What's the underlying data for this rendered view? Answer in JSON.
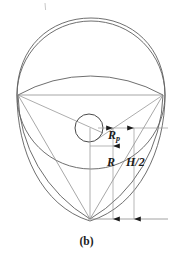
{
  "figure": {
    "caption": "(b)",
    "background_color": "#ffffff",
    "stroke_color": "#555555",
    "dimension_color": "#7a7a7a",
    "text_color": "#1a1a1a",
    "labels": {
      "rotor_radius": "R",
      "pin_radius_base": "R",
      "pin_radius_sub": "p",
      "half_height": "H/2"
    },
    "geometry": {
      "canvas_width": 173,
      "canvas_height": 259,
      "outer_circle": {
        "cx": 91,
        "cy": 95,
        "r": 74
      },
      "pin_circle": {
        "cx": 89,
        "cy": 128,
        "r": 14
      },
      "vertices": [
        {
          "name": "left-vertex",
          "x": 18,
          "y": 95
        },
        {
          "name": "right-vertex",
          "x": 163,
          "y": 95
        },
        {
          "name": "bottom-vertex",
          "x": 90,
          "y": 219
        }
      ],
      "dimension_lines": [
        {
          "name": "rp-line",
          "x": 113,
          "y_top": 128,
          "y_bottom": 146
        },
        {
          "name": "r-line",
          "x": 113,
          "y_top": 146,
          "y_bottom": 219
        },
        {
          "name": "h2-line",
          "x": 134,
          "y_top": 128,
          "y_bottom": 219
        }
      ],
      "tick_mark": {
        "x": 45,
        "y_top": 3,
        "y_bottom": 10
      }
    }
  }
}
